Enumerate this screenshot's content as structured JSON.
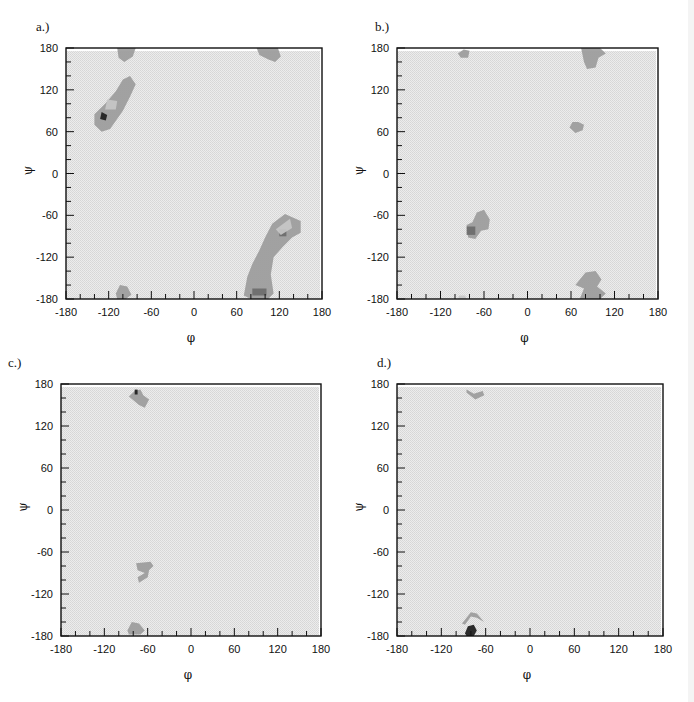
{
  "figure": {
    "panels": [
      {
        "id": "a",
        "label": "a.)"
      },
      {
        "id": "b",
        "label": "b.)"
      },
      {
        "id": "c",
        "label": "c.)"
      },
      {
        "id": "d",
        "label": "d.)"
      }
    ],
    "xlabel": "φ",
    "ylabel": "ψ",
    "tick_labels": [
      "-180",
      "-120",
      "-60",
      "0",
      "60",
      "120",
      "180"
    ]
  },
  "colors": {
    "background": "#e4e4e4",
    "low_density": "#c8c8c8",
    "mid_density": "#9a9a9a",
    "high_density": "#6a6a6a",
    "peak": "#222222",
    "frame": "#111111"
  },
  "chart_data": [
    {
      "panel": "a",
      "type": "heatmap",
      "title": "a.)",
      "xlabel": "φ",
      "ylabel": "ψ",
      "xlim": [
        -180,
        180
      ],
      "ylim": [
        -180,
        180
      ],
      "xticks": [
        -180,
        -120,
        -60,
        0,
        60,
        120,
        180
      ],
      "yticks": [
        -180,
        -120,
        -60,
        0,
        60,
        120,
        180
      ],
      "minor_tick_step": 20,
      "grid": false,
      "regions": [
        {
          "name": "beta-region-upper-left",
          "level": "mid",
          "center": [
            -112,
            110
          ],
          "points": [
            [
              -140,
              70
            ],
            [
              -130,
              60
            ],
            [
              -118,
              64
            ],
            [
              -100,
              90
            ],
            [
              -90,
              110
            ],
            [
              -82,
              128
            ],
            [
              -90,
              140
            ],
            [
              -100,
              135
            ],
            [
              -110,
              118
            ],
            [
              -125,
              100
            ],
            [
              -140,
              85
            ]
          ]
        },
        {
          "name": "beta-core",
          "level": "peak",
          "center": [
            -128,
            82
          ],
          "points": [
            [
              -132,
              78
            ],
            [
              -124,
              76
            ],
            [
              -122,
              84
            ],
            [
              -130,
              88
            ]
          ]
        },
        {
          "name": "beta-core-light",
          "level": "low",
          "center": [
            -118,
            98
          ],
          "points": [
            [
              -125,
              92
            ],
            [
              -110,
              92
            ],
            [
              -108,
              104
            ],
            [
              -122,
              106
            ]
          ]
        },
        {
          "name": "top-left-wrap",
          "level": "mid",
          "center": [
            -95,
            172
          ],
          "points": [
            [
              -108,
              180
            ],
            [
              -82,
              180
            ],
            [
              -86,
              168
            ],
            [
              -98,
              160
            ],
            [
              -106,
              166
            ]
          ]
        },
        {
          "name": "bottom-left-wrap",
          "level": "mid",
          "center": [
            -100,
            -170
          ],
          "points": [
            [
              -110,
              -172
            ],
            [
              -104,
              -160
            ],
            [
              -94,
              -162
            ],
            [
              -88,
              -174
            ],
            [
              -96,
              -180
            ],
            [
              -108,
              -180
            ]
          ]
        },
        {
          "name": "top-right-wrap",
          "level": "mid",
          "center": [
            105,
            172
          ],
          "points": [
            [
              88,
              180
            ],
            [
              118,
              180
            ],
            [
              122,
              168
            ],
            [
              114,
              160
            ],
            [
              104,
              164
            ],
            [
              92,
              170
            ]
          ]
        },
        {
          "name": "left-handed-strand",
          "level": "mid",
          "center": [
            110,
            -120
          ],
          "points": [
            [
              70,
              -175
            ],
            [
              75,
              -148
            ],
            [
              82,
              -130
            ],
            [
              92,
              -110
            ],
            [
              100,
              -92
            ],
            [
              110,
              -72
            ],
            [
              128,
              -58
            ],
            [
              150,
              -68
            ],
            [
              150,
              -85
            ],
            [
              138,
              -92
            ],
            [
              125,
              -105
            ],
            [
              112,
              -120
            ],
            [
              108,
              -145
            ],
            [
              112,
              -172
            ],
            [
              104,
              -180
            ],
            [
              80,
              -180
            ]
          ]
        },
        {
          "name": "left-handed-core",
          "level": "high",
          "center": [
            125,
            -85
          ],
          "points": [
            [
              120,
              -90
            ],
            [
              130,
              -90
            ],
            [
              130,
              -80
            ],
            [
              120,
              -80
            ]
          ]
        },
        {
          "name": "left-handed-bottom-core",
          "level": "high",
          "center": [
            92,
            -170
          ],
          "points": [
            [
              82,
              -175
            ],
            [
              102,
              -175
            ],
            [
              102,
              -165
            ],
            [
              82,
              -165
            ]
          ]
        },
        {
          "name": "left-handed-light",
          "level": "low",
          "center": [
            125,
            -75
          ],
          "points": [
            [
              115,
              -80
            ],
            [
              135,
              -65
            ],
            [
              138,
              -78
            ],
            [
              122,
              -88
            ]
          ]
        }
      ]
    },
    {
      "panel": "b",
      "type": "heatmap",
      "title": "b.)",
      "xlabel": "φ",
      "ylabel": "ψ",
      "xlim": [
        -180,
        180
      ],
      "ylim": [
        -180,
        180
      ],
      "xticks": [
        -180,
        -120,
        -60,
        0,
        60,
        120,
        180
      ],
      "yticks": [
        -180,
        -120,
        -60,
        0,
        60,
        120,
        180
      ],
      "minor_tick_step": 20,
      "grid": false,
      "regions": [
        {
          "name": "top-left-blob",
          "level": "mid",
          "center": [
            -88,
            172
          ],
          "points": [
            [
              -96,
              172
            ],
            [
              -88,
              178
            ],
            [
              -80,
              176
            ],
            [
              -82,
              166
            ],
            [
              -92,
              166
            ]
          ]
        },
        {
          "name": "top-right-wrap",
          "level": "mid",
          "center": [
            88,
            165
          ],
          "points": [
            [
              74,
              180
            ],
            [
              100,
              180
            ],
            [
              108,
              172
            ],
            [
              98,
              166
            ],
            [
              94,
              152
            ],
            [
              82,
              150
            ],
            [
              78,
              160
            ]
          ]
        },
        {
          "name": "left-handed-helix",
          "level": "mid",
          "center": [
            70,
            70
          ],
          "points": [
            [
              58,
              66
            ],
            [
              66,
              58
            ],
            [
              76,
              62
            ],
            [
              78,
              70
            ],
            [
              70,
              74
            ],
            [
              62,
              74
            ]
          ]
        },
        {
          "name": "right-handed-helix",
          "level": "mid",
          "center": [
            -65,
            -72
          ],
          "points": [
            [
              -82,
              -92
            ],
            [
              -72,
              -94
            ],
            [
              -64,
              -82
            ],
            [
              -54,
              -80
            ],
            [
              -52,
              -66
            ],
            [
              -60,
              -52
            ],
            [
              -70,
              -56
            ],
            [
              -76,
              -70
            ],
            [
              -84,
              -74
            ]
          ]
        },
        {
          "name": "right-handed-helix-core",
          "level": "high",
          "center": [
            -78,
            -82
          ],
          "points": [
            [
              -84,
              -88
            ],
            [
              -72,
              -88
            ],
            [
              -72,
              -76
            ],
            [
              -84,
              -76
            ]
          ]
        },
        {
          "name": "bottom-right-wrap",
          "level": "mid",
          "center": [
            90,
            -162
          ],
          "points": [
            [
              66,
              -160
            ],
            [
              80,
              -142
            ],
            [
              94,
              -140
            ],
            [
              102,
              -152
            ],
            [
              96,
              -162
            ],
            [
              108,
              -172
            ],
            [
              100,
              -180
            ],
            [
              72,
              -180
            ],
            [
              78,
              -165
            ]
          ]
        },
        {
          "name": "bottom-left-small",
          "level": "low",
          "center": [
            -90,
            -178
          ],
          "points": [
            [
              -96,
              -180
            ],
            [
              -84,
              -180
            ],
            [
              -86,
              -175
            ],
            [
              -94,
              -175
            ]
          ]
        }
      ]
    },
    {
      "panel": "c",
      "type": "heatmap",
      "title": "c.)",
      "xlabel": "φ",
      "ylabel": "ψ",
      "xlim": [
        -180,
        180
      ],
      "ylim": [
        -180,
        180
      ],
      "xticks": [
        -180,
        -120,
        -60,
        0,
        60,
        120,
        180
      ],
      "yticks": [
        -180,
        -120,
        -60,
        0,
        60,
        120,
        180
      ],
      "minor_tick_step": 20,
      "grid": false,
      "regions": [
        {
          "name": "top-blob",
          "level": "mid",
          "center": [
            -68,
            158
          ],
          "points": [
            [
              -86,
              162
            ],
            [
              -78,
              170
            ],
            [
              -70,
              172
            ],
            [
              -66,
              164
            ],
            [
              -58,
              158
            ],
            [
              -64,
              146
            ],
            [
              -72,
              150
            ]
          ]
        },
        {
          "name": "top-blob-core",
          "level": "peak",
          "center": [
            -76,
            168
          ],
          "points": [
            [
              -78,
              165
            ],
            [
              -74,
              165
            ],
            [
              -74,
              172
            ],
            [
              -78,
              172
            ]
          ]
        },
        {
          "name": "middle-blob",
          "level": "mid",
          "center": [
            -68,
            -88
          ],
          "points": [
            [
              -76,
              -76
            ],
            [
              -56,
              -74
            ],
            [
              -52,
              -80
            ],
            [
              -58,
              -86
            ],
            [
              -60,
              -96
            ],
            [
              -72,
              -104
            ],
            [
              -74,
              -96
            ],
            [
              -64,
              -90
            ],
            [
              -74,
              -86
            ]
          ]
        },
        {
          "name": "bottom-blob",
          "level": "mid",
          "center": [
            -78,
            -170
          ],
          "points": [
            [
              -88,
              -172
            ],
            [
              -82,
              -160
            ],
            [
              -72,
              -162
            ],
            [
              -64,
              -172
            ],
            [
              -70,
              -178
            ],
            [
              -86,
              -178
            ]
          ]
        }
      ]
    },
    {
      "panel": "d",
      "type": "heatmap",
      "title": "d.)",
      "xlabel": "φ",
      "ylabel": "ψ",
      "xlim": [
        -180,
        180
      ],
      "ylim": [
        -180,
        180
      ],
      "xticks": [
        -180,
        -120,
        -60,
        0,
        60,
        120,
        180
      ],
      "yticks": [
        -180,
        -120,
        -60,
        0,
        60,
        120,
        180
      ],
      "minor_tick_step": 20,
      "grid": false,
      "regions": [
        {
          "name": "top-chevron",
          "level": "mid",
          "center": [
            -72,
            166
          ],
          "points": [
            [
              -86,
              172
            ],
            [
              -76,
              166
            ],
            [
              -64,
              170
            ],
            [
              -62,
              164
            ],
            [
              -74,
              158
            ],
            [
              -86,
              168
            ]
          ]
        },
        {
          "name": "bottom-chevron",
          "level": "mid",
          "center": [
            -76,
            -152
          ],
          "points": [
            [
              -92,
              -162
            ],
            [
              -80,
              -146
            ],
            [
              -72,
              -148
            ],
            [
              -62,
              -160
            ],
            [
              -72,
              -154
            ],
            [
              -80,
              -152
            ],
            [
              -88,
              -164
            ]
          ]
        },
        {
          "name": "bottom-peak",
          "level": "peak",
          "center": [
            -80,
            -172
          ],
          "points": [
            [
              -88,
              -176
            ],
            [
              -84,
              -166
            ],
            [
              -76,
              -164
            ],
            [
              -72,
              -172
            ],
            [
              -76,
              -180
            ],
            [
              -86,
              -180
            ]
          ]
        }
      ]
    }
  ]
}
